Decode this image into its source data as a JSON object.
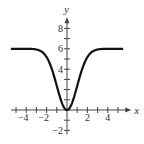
{
  "chart_data": {
    "type": "line",
    "title": "",
    "xlabel": "x",
    "ylabel": "y",
    "xlim": [
      -5.5,
      5.5
    ],
    "ylim": [
      -2.5,
      9
    ],
    "x_ticks": [
      -4,
      -2,
      2,
      4
    ],
    "y_ticks": [
      -2,
      4,
      6,
      8
    ],
    "x_tick_labels": [
      "−4",
      "−2",
      "2",
      "4"
    ],
    "y_tick_labels": [
      "−2",
      "4",
      "6",
      "8"
    ],
    "grid": false,
    "series": [
      {
        "name": "f(x)",
        "x": [
          -5.5,
          -5,
          -4.5,
          -4,
          -3.5,
          -3,
          -2.5,
          -2,
          -1.5,
          -1,
          -0.5,
          0,
          0.5,
          1,
          1.5,
          2,
          2.5,
          3,
          3.5,
          4,
          4.5,
          5,
          5.5
        ],
        "values": [
          6.0,
          6.0,
          6.0,
          6.0,
          5.99,
          5.93,
          5.74,
          5.19,
          4.04,
          2.36,
          0.71,
          0,
          0.71,
          2.36,
          4.04,
          5.19,
          5.74,
          5.93,
          5.99,
          6.0,
          6.0,
          6.0,
          6.0
        ]
      }
    ]
  }
}
